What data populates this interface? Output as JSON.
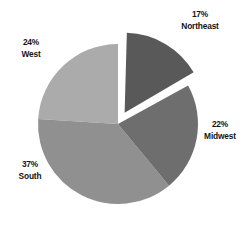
{
  "chart_data": {
    "type": "pie",
    "title": "",
    "subtitle": "",
    "xlabel": "",
    "ylabel": "",
    "legend_position": "none",
    "grid": false,
    "exploded_slices": [
      "Northeast"
    ],
    "start_angle_deg": 0,
    "direction": "clockwise",
    "categories": [
      "Northeast",
      "Midwest",
      "South",
      "West"
    ],
    "values": [
      17,
      22,
      37,
      24
    ],
    "units": "percent",
    "total": 100,
    "slices": [
      {
        "label": "Northeast",
        "value": 17,
        "percent_text": "17%",
        "color": "#595959",
        "exploded": true,
        "label_position": "top-right"
      },
      {
        "label": "Midwest",
        "value": 22,
        "percent_text": "22%",
        "color": "#6e6e6e",
        "exploded": false,
        "label_position": "right"
      },
      {
        "label": "South",
        "value": 37,
        "percent_text": "37%",
        "color": "#909090",
        "exploded": false,
        "label_position": "bottom-left"
      },
      {
        "label": "West",
        "value": 24,
        "percent_text": "24%",
        "color": "#ababab",
        "exploded": false,
        "label_position": "top-left"
      }
    ]
  },
  "labels": {
    "northeast": {
      "pct": "17%",
      "name": "Northeast"
    },
    "midwest": {
      "pct": "22%",
      "name": "Midwest"
    },
    "south": {
      "pct": "37%",
      "name": "South"
    },
    "west": {
      "pct": "24%",
      "name": "West"
    }
  },
  "colors": {
    "background": "#ffffff",
    "text": "#141414",
    "northeast": "#595959",
    "midwest": "#6e6e6e",
    "south": "#909090",
    "west": "#ababab"
  }
}
